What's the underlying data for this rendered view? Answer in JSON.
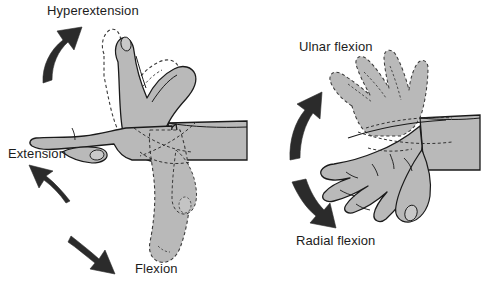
{
  "figure": {
    "background_color": "#ffffff",
    "skin_fill_color": "#b9b9b9",
    "outline_color": "#1a1a1a",
    "arrow_color": "#2b2b2b",
    "width": 493,
    "height": 292
  },
  "panels": [
    {
      "name": "lateral-view",
      "description": "Side view of hand and forearm showing sagittal-plane wrist motion",
      "labels": [
        "Hyperextension",
        "Extension",
        "Flexion"
      ]
    },
    {
      "name": "dorsal-view",
      "description": "Top view of hand and forearm showing frontal-plane wrist deviation",
      "labels": [
        "Ulnar flexion",
        "Radial flexion"
      ]
    }
  ],
  "labels": {
    "hyperextension": "Hyperextension",
    "extension": "Extension",
    "flexion": "Flexion",
    "ulnar_flexion": "Ulnar flexion",
    "radial_flexion": "Radial flexion"
  },
  "arrows": [
    {
      "name": "hyperextension-arrow",
      "direction": "up-right",
      "label": "Hyperextension"
    },
    {
      "name": "extension-arrow",
      "direction": "up-left",
      "label": "Extension"
    },
    {
      "name": "flexion-arrow",
      "direction": "down-right",
      "label": "Flexion"
    },
    {
      "name": "ulnar-flexion-arrow",
      "direction": "up-left",
      "label": "Ulnar flexion"
    },
    {
      "name": "radial-flexion-arrow",
      "direction": "down-right",
      "label": "Radial flexion"
    }
  ]
}
